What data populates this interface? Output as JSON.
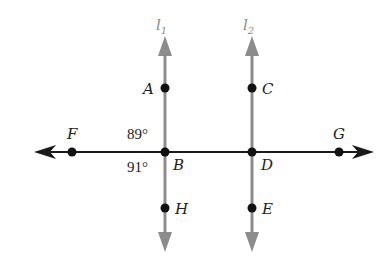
{
  "diagram": {
    "type": "parallel-lines-transversal",
    "colors": {
      "vertical_lines": "#8c8c8c",
      "horizontal_line": "#1a1a1a",
      "points": "#111111",
      "text": "#222222"
    },
    "lines": [
      {
        "id": "l1",
        "label": "l",
        "subscript": "1",
        "x": 165
      },
      {
        "id": "l2",
        "label": "l",
        "subscript": "2",
        "x": 252
      },
      {
        "id": "FG",
        "label": "",
        "y": 152
      }
    ],
    "points": [
      {
        "name": "A",
        "x": 165,
        "y": 88
      },
      {
        "name": "C",
        "x": 252,
        "y": 88
      },
      {
        "name": "F",
        "x": 72,
        "y": 152
      },
      {
        "name": "B",
        "x": 165,
        "y": 152
      },
      {
        "name": "D",
        "x": 252,
        "y": 152
      },
      {
        "name": "G",
        "x": 339,
        "y": 152
      },
      {
        "name": "H",
        "x": 165,
        "y": 208
      },
      {
        "name": "E",
        "x": 252,
        "y": 208
      }
    ],
    "angles": [
      {
        "label": "89°",
        "at": "B",
        "position": "upper-left"
      },
      {
        "label": "91°",
        "at": "B",
        "position": "lower-left"
      }
    ]
  },
  "labels": {
    "l1_main": "l",
    "l1_sub": "1",
    "l2_main": "l",
    "l2_sub": "2",
    "A": "A",
    "C": "C",
    "F": "F",
    "B": "B",
    "D": "D",
    "G": "G",
    "H": "H",
    "E": "E",
    "angle_upper": "89°",
    "angle_lower": "91°"
  }
}
